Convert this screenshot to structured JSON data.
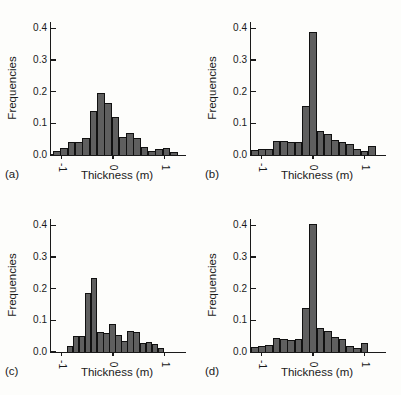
{
  "figure": {
    "background": "#fdfdfb",
    "bar_fill": "#5f5f5f",
    "bar_edge": "#111111",
    "axis_color": "#1a1a1a"
  },
  "chart_data": [
    {
      "type": "bar",
      "subtype": "histogram",
      "label": "(a)",
      "xlabel": "Thickness (m)",
      "ylabel": "Frequencies",
      "ylim": [
        0,
        0.42
      ],
      "yticks": [
        0.0,
        0.1,
        0.2,
        0.3,
        0.4
      ],
      "xticks": [
        -1,
        0,
        1
      ],
      "x_min": -1.165,
      "bin_width": 0.142,
      "values": [
        0.012,
        0.022,
        0.04,
        0.042,
        0.055,
        0.14,
        0.195,
        0.163,
        0.12,
        0.057,
        0.07,
        0.055,
        0.025,
        0.013,
        0.02,
        0.022,
        0.008
      ]
    },
    {
      "type": "bar",
      "subtype": "histogram",
      "label": "(b)",
      "xlabel": "Thickness (m)",
      "ylabel": "Frequencies",
      "ylim": [
        0,
        0.42
      ],
      "yticks": [
        0.0,
        0.1,
        0.2,
        0.3,
        0.4
      ],
      "xticks": [
        -1,
        0,
        1
      ],
      "x_min": -1.207,
      "bin_width": 0.142,
      "values": [
        0.015,
        0.02,
        0.02,
        0.045,
        0.044,
        0.04,
        0.042,
        0.155,
        0.39,
        0.075,
        0.065,
        0.046,
        0.04,
        0.035,
        0.02,
        0.012,
        0.03
      ]
    },
    {
      "type": "bar",
      "subtype": "histogram",
      "label": "(c)",
      "xlabel": "Thickness (m)",
      "ylabel": "Frequencies",
      "ylim": [
        0,
        0.42
      ],
      "yticks": [
        0.0,
        0.1,
        0.2,
        0.3,
        0.4
      ],
      "xticks": [
        -1,
        0,
        1
      ],
      "x_min": -0.9,
      "bin_width": 0.118,
      "values": [
        0.018,
        0.05,
        0.05,
        0.185,
        0.235,
        0.062,
        0.06,
        0.088,
        0.055,
        0.035,
        0.065,
        0.063,
        0.03,
        0.032,
        0.025,
        0.012
      ]
    },
    {
      "type": "bar",
      "subtype": "histogram",
      "label": "(d)",
      "xlabel": "Thickness (m)",
      "ylabel": "Frequencies",
      "ylim": [
        0,
        0.42
      ],
      "yticks": [
        0.0,
        0.1,
        0.2,
        0.3,
        0.4
      ],
      "xticks": [
        -1,
        0,
        1
      ],
      "x_min": -1.207,
      "bin_width": 0.142,
      "values": [
        0.015,
        0.02,
        0.022,
        0.045,
        0.04,
        0.038,
        0.04,
        0.14,
        0.405,
        0.075,
        0.065,
        0.046,
        0.04,
        0.02,
        0.012,
        0.03
      ]
    }
  ]
}
